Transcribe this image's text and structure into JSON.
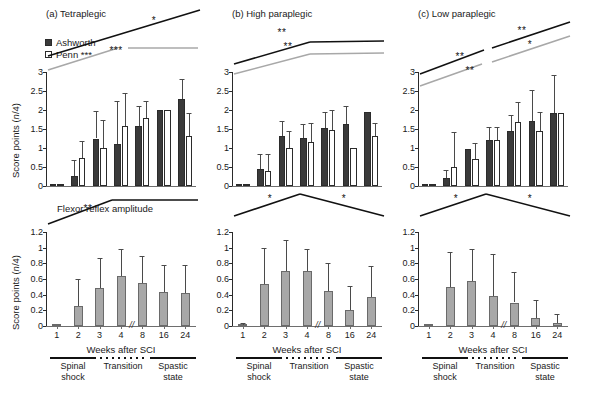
{
  "figure": {
    "axis": {
      "ylabel_top": "Score points (n/4)",
      "ylabel_bottom": "Score points (n/4)",
      "xlabel": "Weeks after SCI",
      "break_mark": "//",
      "xticks": [
        "1",
        "2",
        "3",
        "4",
        "8",
        "16",
        "24"
      ],
      "yticks_top": [
        "0",
        "0.5",
        "1",
        "1.5",
        "2",
        "2.5",
        "3"
      ],
      "yticks_bottom": [
        "0",
        "0.2",
        "0.4",
        "0.6",
        "0.8",
        "1",
        "1.2"
      ],
      "ylim_top": [
        0,
        3
      ],
      "ylim_bottom": [
        0,
        1.2
      ]
    },
    "legend": {
      "ashworth_label": "Ashworth",
      "penn_label": "Penn ***"
    },
    "subtitle_bottom_a": "Flexor reflex amplitude",
    "phases": [
      {
        "label": "Spinal\nshock",
        "style": "solid"
      },
      {
        "label": "Transition",
        "style": "dotted"
      },
      {
        "label": "Spastic\nstate",
        "style": "solid"
      }
    ],
    "panels": [
      {
        "id": "a",
        "title": "(a) Tetraplegic"
      },
      {
        "id": "b",
        "title": "(b) High paraplegic"
      },
      {
        "id": "c",
        "title": "(c) Low paraplegic"
      }
    ]
  },
  "chart_data": [
    {
      "id": "a-top",
      "type": "bar",
      "title": "(a) Tetraplegic",
      "xlabel": "Weeks after SCI",
      "ylabel": "Score points (n/4)",
      "ylim": [
        0,
        3
      ],
      "categories": [
        "1",
        "2",
        "3",
        "4",
        "8",
        "16",
        "24"
      ],
      "series": [
        {
          "name": "Ashworth",
          "values": [
            0.01,
            0.27,
            1.25,
            1.11,
            1.59,
            2.0,
            2.3
          ],
          "errors": [
            0.0,
            0.42,
            0.73,
            1.13,
            0.52,
            0.0,
            0.52
          ]
        },
        {
          "name": "Penn",
          "values": [
            0.01,
            0.74,
            1.01,
            1.59,
            1.79,
            2.0,
            1.32
          ],
          "errors": [
            0.0,
            0.44,
            0.72,
            0.86,
            0.44,
            0.0,
            0.6
          ]
        }
      ],
      "annotations": [
        {
          "series": "Ashworth",
          "color": "#111111",
          "stars": "*",
          "shape": "rising"
        },
        {
          "series": "Penn",
          "color": "#a8a8a8",
          "stars": "***",
          "shape": "rising-then-flat"
        }
      ]
    },
    {
      "id": "b-top",
      "type": "bar",
      "title": "(b) High paraplegic",
      "xlabel": "Weeks after SCI",
      "ylabel": "Score points (n/4)",
      "ylim": [
        0,
        3
      ],
      "categories": [
        "1",
        "2",
        "3",
        "4",
        "8",
        "16",
        "24"
      ],
      "series": [
        {
          "name": "Ashworth",
          "values": [
            0.01,
            0.45,
            1.32,
            1.26,
            1.53,
            1.64,
            1.94
          ],
          "errors": [
            0.0,
            0.38,
            0.4,
            0.36,
            0.42,
            0.46,
            0.0
          ]
        },
        {
          "name": "Penn",
          "values": [
            0.01,
            0.4,
            0.99,
            1.15,
            1.47,
            1.0,
            1.31
          ],
          "errors": [
            0.0,
            0.43,
            0.47,
            0.5,
            0.52,
            0.0,
            0.36
          ]
        }
      ],
      "annotations": [
        {
          "series": "Ashworth",
          "color": "#111111",
          "stars": "**",
          "shape": "rising-then-flat"
        },
        {
          "series": "Penn",
          "color": "#a8a8a8",
          "stars": "**",
          "shape": "rising-then-flat"
        }
      ]
    },
    {
      "id": "c-top",
      "type": "bar",
      "title": "(c) Low paraplegic",
      "xlabel": "Weeks after SCI",
      "ylabel": "Score points (n/4)",
      "ylim": [
        0,
        3
      ],
      "categories": [
        "1",
        "2",
        "3",
        "4",
        "8",
        "16",
        "24"
      ],
      "series": [
        {
          "name": "Ashworth",
          "values": [
            0.01,
            0.21,
            0.97,
            1.22,
            1.46,
            1.7,
            1.93
          ],
          "errors": [
            0.0,
            0.2,
            0.0,
            0.32,
            0.4,
            0.82,
            0.98
          ]
        },
        {
          "name": "Penn",
          "values": [
            0.01,
            0.49,
            0.7,
            1.21,
            1.69,
            1.45,
            1.93
          ],
          "errors": [
            0.0,
            0.92,
            0.44,
            0.34,
            0.51,
            0.5,
            0.0
          ]
        }
      ],
      "annotations": [
        {
          "series": "Ashworth",
          "color": "#111111",
          "stars": "** / **",
          "shape": "two-segment"
        },
        {
          "series": "Penn",
          "color": "#a8a8a8",
          "stars": "** / *",
          "shape": "two-segment"
        }
      ]
    },
    {
      "id": "a-bottom",
      "type": "bar",
      "title": "Flexor reflex amplitude",
      "xlabel": "Weeks after SCI",
      "ylabel": "Score points (n/4)",
      "ylim": [
        0,
        1.2
      ],
      "categories": [
        "1",
        "2",
        "3",
        "4",
        "8",
        "16",
        "24"
      ],
      "series": [
        {
          "name": "Flexor reflex amplitude",
          "values": [
            0.005,
            0.255,
            0.48,
            0.64,
            0.55,
            0.43,
            0.425
          ],
          "errors": [
            0.0,
            0.35,
            0.39,
            0.34,
            0.35,
            0.35,
            0.35
          ]
        }
      ],
      "annotations": [
        {
          "stars": "**",
          "shape": "rising-then-flat",
          "color": "#111111"
        }
      ]
    },
    {
      "id": "b-bottom",
      "type": "bar",
      "title": "",
      "xlabel": "Weeks after SCI",
      "ylabel": "Score points (n/4)",
      "ylim": [
        0,
        1.2
      ],
      "categories": [
        "1",
        "2",
        "3",
        "4",
        "8",
        "16",
        "24"
      ],
      "series": [
        {
          "name": "Flexor reflex amplitude",
          "values": [
            0.01,
            0.54,
            0.7,
            0.7,
            0.45,
            0.21,
            0.375
          ],
          "errors": [
            0.03,
            0.46,
            0.4,
            0.28,
            0.35,
            0.3,
            0.39
          ]
        }
      ],
      "annotations": [
        {
          "stars": "*",
          "shape": "inverted-v-left",
          "color": "#111111"
        },
        {
          "stars": "*",
          "shape": "inverted-v-right",
          "color": "#111111"
        }
      ]
    },
    {
      "id": "c-bottom",
      "type": "bar",
      "title": "",
      "xlabel": "Weeks after SCI",
      "ylabel": "Score points (n/4)",
      "ylim": [
        0,
        1.2
      ],
      "categories": [
        "1",
        "2",
        "3",
        "4",
        "8",
        "16",
        "24"
      ],
      "series": [
        {
          "name": "Flexor reflex amplitude",
          "values": [
            0.0,
            0.5,
            0.575,
            0.385,
            0.3,
            0.1,
            0.035
          ],
          "errors": [
            0.0,
            0.44,
            0.41,
            0.53,
            0.39,
            0.23,
            0.12
          ]
        }
      ],
      "annotations": [
        {
          "stars": "*",
          "shape": "inverted-v-left",
          "color": "#111111"
        },
        {
          "stars": "*",
          "shape": "inverted-v-right",
          "color": "#111111"
        }
      ]
    }
  ]
}
